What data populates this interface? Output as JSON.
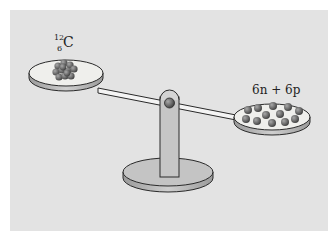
{
  "figure": {
    "left_pan": {
      "label_mass_number": "12",
      "label_atomic_number": "6",
      "label_symbol": "C",
      "content": "carbon-12 nucleus (cluster of 12 nucleons)"
    },
    "right_pan": {
      "label": "6n + 6p",
      "particle_count": 12,
      "content": "6 separate neutrons and 6 separate protons"
    },
    "colors": {
      "background": "#e3e3e3",
      "pan_top": "#efefec",
      "pan_side": "#b8b8b8",
      "stand": "#c6c6c6",
      "particle": "#6e6e6e",
      "outline": "#2a2a2a"
    }
  }
}
